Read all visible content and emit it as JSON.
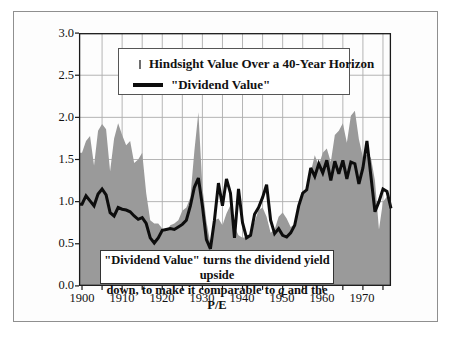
{
  "figure": {
    "legend": {
      "items": [
        {
          "swatch": "gray-area",
          "label": "Hindsight Value Over a 40-Year Horizon"
        },
        {
          "swatch": "black-line",
          "label": "\"Dividend Value\""
        }
      ]
    },
    "annotation": {
      "line1": "\"Dividend Value\" turns the dividend yield upside",
      "line2_pre": "down, to make it comparable to ",
      "line2_italic": "q",
      "line2_post": " and the P/E"
    },
    "colors": {
      "area_fill": "#9a9a9a",
      "line": "#0d0d0d",
      "gridline": "#adadad",
      "plot_border": "#1a1a1a",
      "frame_border": "#8f8f8f",
      "background": "#ffffff"
    }
  },
  "chart_data": {
    "type": "area",
    "title": "",
    "xlabel": "",
    "ylabel": "",
    "xlim": [
      1900,
      1977
    ],
    "ylim": [
      0.0,
      3.0
    ],
    "grid": {
      "visible": true,
      "x_interval_years": 5,
      "y_interval": 0.5
    },
    "legend_position": "top-center-box",
    "yticks": [
      "3.0",
      "2.5",
      "2.0",
      "1.5",
      "1.0",
      "0.5",
      "0.0"
    ],
    "xticks": [
      "1900",
      "1910",
      "1920",
      "1930",
      "1940",
      "1950",
      "1960",
      "1970"
    ],
    "x": [
      1900,
      1901,
      1902,
      1903,
      1904,
      1905,
      1906,
      1907,
      1908,
      1909,
      1910,
      1911,
      1912,
      1913,
      1914,
      1915,
      1916,
      1917,
      1918,
      1919,
      1920,
      1921,
      1922,
      1923,
      1924,
      1925,
      1926,
      1927,
      1928,
      1929,
      1930,
      1931,
      1932,
      1933,
      1934,
      1935,
      1936,
      1937,
      1938,
      1939,
      1940,
      1941,
      1942,
      1943,
      1944,
      1945,
      1946,
      1947,
      1948,
      1949,
      1950,
      1951,
      1952,
      1953,
      1954,
      1955,
      1956,
      1957,
      1958,
      1959,
      1960,
      1961,
      1962,
      1963,
      1964,
      1965,
      1966,
      1967,
      1968,
      1969,
      1970,
      1971,
      1972,
      1973,
      1974,
      1975,
      1976,
      1977
    ],
    "series": [
      {
        "name": "Hindsight Value Over a 40-Year Horizon",
        "style": "area",
        "color": "#9a9a9a",
        "values": [
          1.58,
          1.72,
          1.78,
          1.43,
          1.84,
          1.92,
          1.86,
          1.36,
          1.75,
          1.93,
          1.79,
          1.67,
          1.72,
          1.46,
          1.5,
          1.58,
          1.1,
          0.78,
          0.74,
          0.74,
          0.68,
          0.65,
          0.72,
          0.74,
          0.78,
          0.89,
          0.93,
          1.05,
          1.6,
          2.06,
          1.17,
          0.77,
          0.5,
          0.78,
          0.8,
          0.72,
          0.86,
          0.96,
          0.7,
          0.6,
          0.57,
          0.58,
          0.62,
          0.76,
          0.9,
          0.93,
          0.82,
          0.63,
          0.67,
          0.82,
          0.87,
          0.8,
          0.7,
          0.73,
          0.97,
          1.06,
          1.18,
          1.35,
          1.55,
          1.43,
          1.58,
          1.63,
          1.47,
          1.79,
          1.84,
          1.93,
          1.7,
          2.02,
          2.08,
          1.74,
          1.53,
          1.56,
          1.52,
          1.25,
          0.67,
          1.0,
          1.06,
          0.9
        ]
      },
      {
        "name": "\"Dividend Value\"",
        "style": "line",
        "color": "#0d0d0d",
        "values": [
          0.97,
          1.07,
          1.01,
          0.95,
          1.09,
          1.15,
          1.08,
          0.87,
          0.83,
          0.93,
          0.91,
          0.9,
          0.88,
          0.83,
          0.79,
          0.81,
          0.74,
          0.57,
          0.51,
          0.57,
          0.66,
          0.67,
          0.68,
          0.67,
          0.7,
          0.73,
          0.78,
          0.95,
          1.17,
          1.28,
          0.95,
          0.55,
          0.44,
          0.78,
          1.22,
          0.95,
          1.27,
          1.1,
          0.57,
          1.15,
          0.75,
          0.57,
          0.6,
          0.85,
          0.93,
          1.05,
          1.2,
          0.78,
          0.62,
          0.68,
          0.6,
          0.58,
          0.63,
          0.72,
          0.95,
          1.1,
          1.14,
          1.4,
          1.3,
          1.45,
          1.34,
          1.49,
          1.25,
          1.48,
          1.33,
          1.49,
          1.27,
          1.47,
          1.45,
          1.21,
          1.4,
          1.72,
          1.3,
          0.88,
          1.0,
          1.15,
          1.12,
          0.92
        ]
      }
    ]
  }
}
